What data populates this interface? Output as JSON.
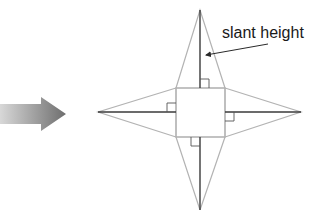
{
  "diagram": {
    "title_clipped": "",
    "label": "slant height",
    "colors": {
      "outline": "#b3b3b3",
      "slant_line": "#3a3a3a",
      "arrow_light": "#d6d6d6",
      "arrow_dark": "#7a7a7a",
      "text": "#1a1a1a"
    },
    "net": {
      "type": "square pyramid net",
      "square": {
        "x": 176,
        "y": 88,
        "size": 49
      },
      "apexes": {
        "top": [
          200,
          10
        ],
        "bottom": [
          200,
          210
        ],
        "left": [
          98,
          112
        ],
        "right": [
          301,
          112
        ]
      }
    }
  }
}
